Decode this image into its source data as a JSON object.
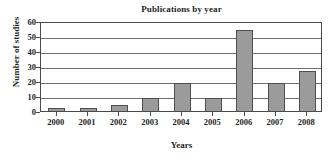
{
  "chart_data": {
    "type": "bar",
    "title": "Publications by year",
    "xlabel": "Years",
    "ylabel": "Number of studies",
    "categories": [
      "2000",
      "2001",
      "2002",
      "2003",
      "2004",
      "2005",
      "2006",
      "2007",
      "2008"
    ],
    "values": [
      2,
      2,
      4,
      9,
      19,
      9,
      54,
      19,
      27
    ],
    "ylim": [
      0,
      60
    ],
    "yticks": [
      0,
      10,
      20,
      30,
      40,
      50,
      60
    ],
    "ytick_labels": [
      "0",
      "10",
      "20",
      "30",
      "40",
      "50",
      "60"
    ],
    "grid": true,
    "grid_axis": "y",
    "legend": false,
    "series": [
      {
        "name": "Number of studies",
        "values": [
          2,
          2,
          4,
          9,
          19,
          9,
          54,
          19,
          27
        ]
      }
    ],
    "bar_fill_color": "#9b9b9b",
    "bar_edge_color": "#4f4f4f",
    "axis_color": "#4a4a4a",
    "background_color": "#ffffff"
  }
}
